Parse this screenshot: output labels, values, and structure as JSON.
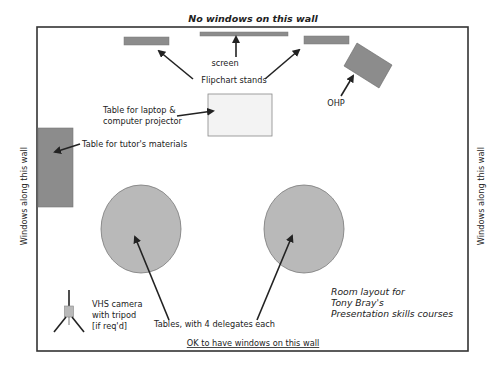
{
  "diagram": {
    "type": "room-layout",
    "walls": {
      "top": "No windows on this wall",
      "bottom": "OK to have windows on this wall",
      "left": "Windows along this wall",
      "right": "Windows along this wall"
    },
    "labels": {
      "screen": "screen",
      "flipchart": "Flipchart stands",
      "ohp": "OHP",
      "laptop_line1": "Table for laptop &",
      "laptop_line2": "computer projector",
      "tutor": "Table for tutor's materials",
      "camera_line1": "VHS camera",
      "camera_line2": "with tripod",
      "camera_line3": "[if req'd]",
      "tables": "Tables, with 4 delegates each"
    },
    "title": {
      "line1": "Room layout for",
      "line2": "Tony Bray's",
      "line3": "Presentation skills courses"
    },
    "colors": {
      "furniture_dark": "#8c8c8c",
      "furniture_mid": "#b9b9b9",
      "furniture_light": "#f3f3f3",
      "wall": "#333333",
      "arrow": "#222222"
    }
  }
}
